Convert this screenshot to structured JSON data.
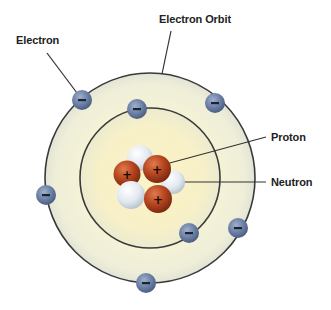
{
  "labels": {
    "electron": "Electron",
    "electron_orbit": "Electron Orbit",
    "proton": "Proton",
    "neutron": "Neutron"
  },
  "symbols": {
    "electron_charge": "−",
    "proton_charge": "+"
  },
  "colors": {
    "background": "#ffffff",
    "orbit_fill_outer": "#f3f1dc",
    "orbit_fill_inner": "#f7f0c8",
    "orbit_stroke": "#3a3a3a",
    "electron": "#6a7fa3",
    "proton": "#b5451f",
    "neutron": "#dfe6ee",
    "label_text": "#222222",
    "leader_line": "#222222"
  },
  "diagram": {
    "outer_orbit": {
      "cx": 150,
      "cy": 178,
      "r": 105
    },
    "inner_orbit": {
      "cx": 150,
      "cy": 178,
      "r": 70
    },
    "electrons_outer": [
      {
        "x": 82,
        "y": 100
      },
      {
        "x": 215,
        "y": 103
      },
      {
        "x": 46,
        "y": 195
      },
      {
        "x": 238,
        "y": 228
      },
      {
        "x": 146,
        "y": 283
      }
    ],
    "electrons_inner": [
      {
        "x": 137,
        "y": 109
      },
      {
        "x": 189,
        "y": 233
      }
    ],
    "protons": [
      {
        "x": 127,
        "y": 174
      },
      {
        "x": 157,
        "y": 169
      },
      {
        "x": 158,
        "y": 199
      }
    ],
    "neutrons": [
      {
        "x": 140,
        "y": 158
      },
      {
        "x": 173,
        "y": 182
      },
      {
        "x": 131,
        "y": 195
      }
    ],
    "counts": {
      "electrons": 7,
      "protons": 3,
      "neutrons": 3
    }
  }
}
